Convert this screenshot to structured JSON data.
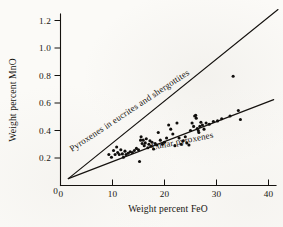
{
  "chart_data": {
    "type": "scatter",
    "title": "",
    "xlabel": "Weight percent FeO",
    "ylabel": "Weight percent MnO",
    "xlim": [
      0,
      42
    ],
    "ylim": [
      0,
      1.28
    ],
    "grid": false,
    "legend_position": "inline-annotations",
    "xticks": [
      0,
      10,
      20,
      30,
      40
    ],
    "xtick_labels": [
      "0",
      "10",
      "20",
      "30",
      "40"
    ],
    "yticks": [
      0.2,
      0.4,
      0.6,
      0.8,
      1.0,
      1.2
    ],
    "ytick_labels": [
      "0.2",
      "0.4",
      "0.6",
      "0.8",
      "1.0",
      "1.2"
    ],
    "y_origin_label": "0",
    "annotations": [
      {
        "name": "eucrite-shergottite-trend-label",
        "text": "Pyroxenes in eucrites and shergottites",
        "rotation_deg": -33.5
      },
      {
        "name": "lunar-pyroxene-trend-label",
        "text": "Lunar pyroxenes",
        "rotation_deg": -11.5
      }
    ],
    "series": [
      {
        "name": "Pyroxenes in eucrites and shergottites",
        "type": "line",
        "description": "Steep reference trend line",
        "line_points": [
          [
            1.5,
            0.05
          ],
          [
            42.0,
            1.28
          ]
        ]
      },
      {
        "name": "Lunar pyroxenes",
        "type": "line",
        "description": "Shallow reference trend line through lunar data",
        "line_points": [
          [
            1.5,
            0.05
          ],
          [
            41.0,
            0.625
          ]
        ]
      },
      {
        "name": "Lunar pyroxenes",
        "type": "scatter",
        "description": "Measured lunar pyroxene compositions",
        "points": [
          [
            9.3,
            0.225
          ],
          [
            9.8,
            0.205
          ],
          [
            10.2,
            0.255
          ],
          [
            10.5,
            0.225
          ],
          [
            10.8,
            0.28
          ],
          [
            11.0,
            0.24
          ],
          [
            11.3,
            0.225
          ],
          [
            11.6,
            0.26
          ],
          [
            11.9,
            0.23
          ],
          [
            12.1,
            0.205
          ],
          [
            12.4,
            0.25
          ],
          [
            12.6,
            0.225
          ],
          [
            13.0,
            0.235
          ],
          [
            13.4,
            0.245
          ],
          [
            13.8,
            0.24
          ],
          [
            14.2,
            0.255
          ],
          [
            14.6,
            0.27
          ],
          [
            15.0,
            0.26
          ],
          [
            15.2,
            0.175
          ],
          [
            15.4,
            0.33
          ],
          [
            15.5,
            0.355
          ],
          [
            15.7,
            0.305
          ],
          [
            15.9,
            0.33
          ],
          [
            16.1,
            0.29
          ],
          [
            16.3,
            0.31
          ],
          [
            16.5,
            0.34
          ],
          [
            16.8,
            0.275
          ],
          [
            17.0,
            0.3
          ],
          [
            17.2,
            0.325
          ],
          [
            17.4,
            0.285
          ],
          [
            17.6,
            0.315
          ],
          [
            17.9,
            0.265
          ],
          [
            18.2,
            0.305
          ],
          [
            18.5,
            0.295
          ],
          [
            18.8,
            0.385
          ],
          [
            19.2,
            0.33
          ],
          [
            19.6,
            0.3
          ],
          [
            20.0,
            0.315
          ],
          [
            20.4,
            0.345
          ],
          [
            20.8,
            0.44
          ],
          [
            21.2,
            0.41
          ],
          [
            21.6,
            0.375
          ],
          [
            22.0,
            0.29
          ],
          [
            22.4,
            0.455
          ],
          [
            22.8,
            0.345
          ],
          [
            23.2,
            0.3
          ],
          [
            23.6,
            0.325
          ],
          [
            24.0,
            0.355
          ],
          [
            24.3,
            0.31
          ],
          [
            24.7,
            0.295
          ],
          [
            25.0,
            0.4
          ],
          [
            25.3,
            0.455
          ],
          [
            25.6,
            0.43
          ],
          [
            25.8,
            0.505
          ],
          [
            26.0,
            0.51
          ],
          [
            26.1,
            0.49
          ],
          [
            26.3,
            0.415
          ],
          [
            26.5,
            0.4
          ],
          [
            26.6,
            0.385
          ],
          [
            26.8,
            0.43
          ],
          [
            27.0,
            0.46
          ],
          [
            27.3,
            0.44
          ],
          [
            27.6,
            0.41
          ],
          [
            28.0,
            0.455
          ],
          [
            28.6,
            0.445
          ],
          [
            29.4,
            0.465
          ],
          [
            30.2,
            0.47
          ],
          [
            31.0,
            0.485
          ],
          [
            32.6,
            0.505
          ],
          [
            33.2,
            0.795
          ],
          [
            34.2,
            0.545
          ],
          [
            34.6,
            0.48
          ]
        ]
      }
    ]
  }
}
